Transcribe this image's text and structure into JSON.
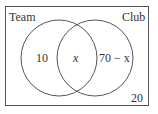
{
  "diagram": {
    "type": "venn",
    "sets": [
      {
        "name": "Team",
        "only_value": "10"
      },
      {
        "name": "Club",
        "only_value": "70 − x"
      }
    ],
    "intersection_value": "x",
    "outside_value": "20",
    "colors": {
      "stroke": "#555555",
      "text": "#333333",
      "background": "#ffffff"
    }
  }
}
